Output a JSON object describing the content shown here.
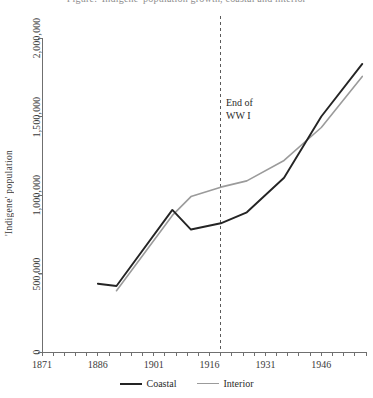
{
  "chart_data": {
    "type": "line",
    "title": "Figure: 'Indigene' population growth, coastal and interior",
    "xlabel": "",
    "ylabel": "'Indigene' population",
    "xlim": [
      1871,
      1958
    ],
    "ylim": [
      0,
      2000000
    ],
    "grid": false,
    "legend_position": "bottom-center",
    "x_tick_labels": [
      "1871",
      "1886",
      "1901",
      "1916",
      "1931",
      "1946"
    ],
    "x_tick_values": [
      1871,
      1886,
      1901,
      1916,
      1931,
      1946
    ],
    "y_tick_labels": [
      "0",
      "500,000",
      "1,000,000",
      "1,500,000",
      "2,000,000"
    ],
    "y_tick_values": [
      0,
      500000,
      1000000,
      1500000,
      2000000
    ],
    "minor_x_tick_interval": 3,
    "annotations": [
      {
        "name": "end-of-wwi",
        "line1": "End of",
        "line2": "WW I",
        "x": 1919,
        "style": "dashed-vertical"
      }
    ],
    "series": [
      {
        "name": "Coastal",
        "color": "#242424",
        "x": [
          1886,
          1891,
          1906,
          1911,
          1919,
          1926,
          1936,
          1946,
          1957
        ],
        "values": [
          435000,
          420000,
          905000,
          780000,
          820000,
          890000,
          1110000,
          1500000,
          1835000
        ]
      },
      {
        "name": "Interior",
        "color": "#9b9b9b",
        "x": [
          1891,
          1906,
          1911,
          1919,
          1926,
          1936,
          1946,
          1957
        ],
        "values": [
          390000,
          870000,
          990000,
          1050000,
          1090000,
          1220000,
          1430000,
          1755000
        ]
      }
    ]
  },
  "legend": {
    "entries": [
      {
        "label": "Coastal",
        "color": "#242424"
      },
      {
        "label": "Interior",
        "color": "#9b9b9b"
      }
    ]
  }
}
